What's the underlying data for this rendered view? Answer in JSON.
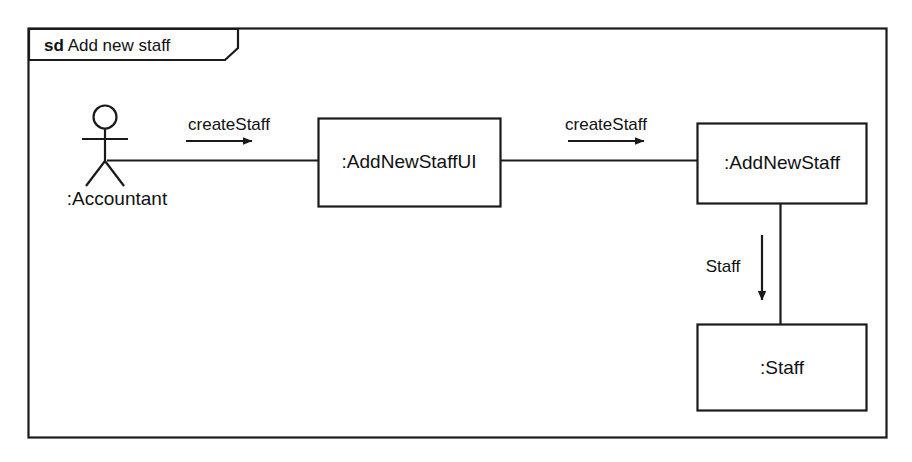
{
  "diagram": {
    "kind": "sd",
    "name": "Add new staff",
    "frame_label_kind": "sd",
    "frame_label_name": "Add new staff",
    "type": "uml-communication-diagram",
    "accent_color": "#1a1a1a",
    "background_color": "#ffffff"
  },
  "actor": {
    "name": ":Accountant",
    "icon": "stick-figure-actor-icon"
  },
  "objects": [
    {
      "id": "add-new-staff-ui",
      "label": ":AddNewStaffUI"
    },
    {
      "id": "add-new-staff",
      "label": ":AddNewStaff"
    },
    {
      "id": "staff",
      "label": ":Staff"
    }
  ],
  "messages": [
    {
      "id": "msg-1",
      "label": "createStaff",
      "from": ":Accountant",
      "to": ":AddNewStaffUI",
      "direction": "right"
    },
    {
      "id": "msg-2",
      "label": "createStaff",
      "from": ":AddNewStaffUI",
      "to": ":AddNewStaff",
      "direction": "right"
    },
    {
      "id": "msg-3",
      "label": "Staff",
      "from": ":AddNewStaff",
      "to": ":Staff",
      "direction": "down"
    }
  ]
}
